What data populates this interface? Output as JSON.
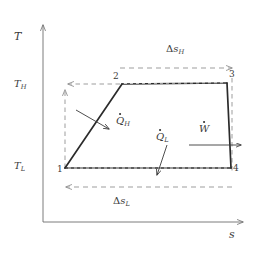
{
  "figure": {
    "kind": "thermodynamic-temperature-entropy-diagram",
    "background_color": "#ffffff",
    "line_color": "#2b2b2b",
    "axis_color": "#6e6e6e",
    "dashed_color": "#8c8c8c",
    "text_color": "#3a3a3a"
  },
  "axes": {
    "y": {
      "label": "T",
      "label_x": 14,
      "label_y": 31,
      "ticks": [
        {
          "label_main": "T",
          "label_sub": "H",
          "x": 14,
          "y": 79
        },
        {
          "label_main": "T",
          "label_sub": "L",
          "x": 14,
          "y": 161
        }
      ]
    },
    "x": {
      "label": "s",
      "label_x": 229,
      "label_y": 229
    }
  },
  "states": [
    {
      "label": "1",
      "x": 57,
      "y": 165
    },
    {
      "label": "2",
      "x": 113,
      "y": 72
    },
    {
      "label": "3",
      "x": 229,
      "y": 70
    },
    {
      "label": "4",
      "x": 233,
      "y": 164
    }
  ],
  "quantities": [
    {
      "name": "heat-input-high",
      "main": "Q",
      "sub": "H",
      "dot": true,
      "x": 116,
      "y": 116
    },
    {
      "name": "heat-rejected-low",
      "main": "Q",
      "sub": "L",
      "dot": true,
      "x": 156,
      "y": 132
    },
    {
      "name": "work-output",
      "main": "W",
      "sub": "",
      "dot": true,
      "x": 199,
      "y": 124
    }
  ],
  "entropy_spans": [
    {
      "name": "delta-s-high",
      "main": "s",
      "sub": "H",
      "prefix": "Δ",
      "x": 166,
      "y": 44,
      "direction": "right"
    },
    {
      "name": "delta-s-low",
      "main": "s",
      "sub": "L",
      "prefix": "Δ",
      "x": 113,
      "y": 196,
      "direction": "left"
    }
  ],
  "geometry": {
    "origin": {
      "x": 43,
      "y": 222
    },
    "cycle_points": [
      {
        "id": "1",
        "x": 65,
        "y": 168
      },
      {
        "id": "2",
        "x": 122,
        "y": 84
      },
      {
        "id": "3",
        "x": 227,
        "y": 83
      },
      {
        "id": "4",
        "x": 231,
        "y": 168
      }
    ]
  }
}
